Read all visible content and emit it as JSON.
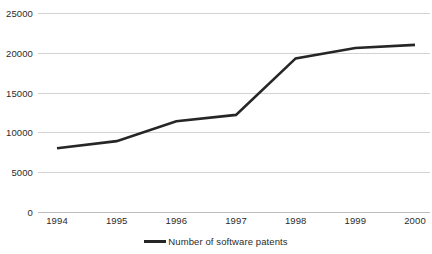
{
  "chart_data": {
    "type": "line",
    "title": "",
    "xlabel": "",
    "ylabel": "",
    "categories": [
      "1994",
      "1995",
      "1996",
      "1997",
      "1998",
      "1999",
      "2000"
    ],
    "series": [
      {
        "name": "Number of software patents",
        "values": [
          8000,
          8900,
          11400,
          12200,
          19300,
          20600,
          21000
        ],
        "color": "#262626"
      }
    ],
    "ylim": [
      0,
      25000
    ],
    "yticks": [
      0,
      5000,
      10000,
      15000,
      20000,
      25000
    ],
    "ytick_labels": [
      "0",
      "5000",
      "10000",
      "15000",
      "20000",
      "25000"
    ],
    "grid": true,
    "legend_position": "bottom",
    "gridline_color": "#d2d3d5",
    "axis_color": "#bcbdbf",
    "background": "#ffffff",
    "text_color": "#2b2b2b"
  },
  "legend": {
    "entries": [
      {
        "label": "Number of software patents"
      }
    ]
  }
}
